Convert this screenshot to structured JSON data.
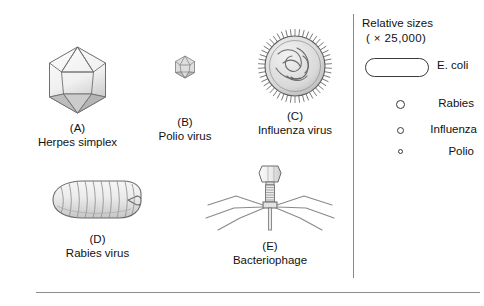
{
  "figure": {
    "specimens": [
      {
        "letter": "(A)",
        "name": "Herpes simplex",
        "icon": "icosahedron-virion-icon"
      },
      {
        "letter": "(B)",
        "name": "Polio virus",
        "icon": "small-icosahedron-virion-icon"
      },
      {
        "letter": "(C)",
        "name": "Influenza virus",
        "icon": "spiked-spherical-virion-icon"
      },
      {
        "letter": "(D)",
        "name": "Rabies virus",
        "icon": "bullet-shaped-virion-icon"
      },
      {
        "letter": "(E)",
        "name": "Bacteriophage",
        "icon": "bacteriophage-icon"
      }
    ],
    "legend": {
      "title_line1": "Relative sizes",
      "title_line2": "( × 25,000)",
      "ecoli_label": "E. coli",
      "items": [
        {
          "label": "Rabies"
        },
        {
          "label": "Influenza"
        },
        {
          "label": "Polio"
        }
      ]
    },
    "colors": {
      "line": "#3a3a3a",
      "divider": "#8a8a8a",
      "text": "#111111",
      "background": "#ffffff"
    }
  }
}
